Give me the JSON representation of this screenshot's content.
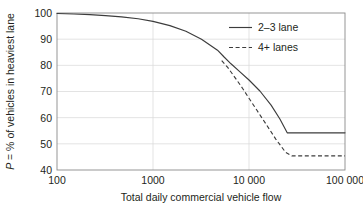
{
  "chart_data": {
    "type": "line",
    "title": "",
    "xlabel": "Total daily commercial vehicle flow",
    "ylabel": "P = % of vehicles in heaviest lane",
    "ylabel_parts": {
      "variable": "P",
      "rest": " = % of vehicles in heaviest lane"
    },
    "xscale": "log",
    "yscale": "linear",
    "xlim": [
      100,
      100000
    ],
    "ylim": [
      40,
      100
    ],
    "grid": true,
    "grid_axes": "both-major",
    "legend_position": "upper-right-inside",
    "xticks": [
      100,
      1000,
      10000,
      100000
    ],
    "xtick_labels": [
      "100",
      "1000",
      "10 000",
      "100 000"
    ],
    "yticks": [
      40,
      50,
      60,
      70,
      80,
      90,
      100
    ],
    "ytick_labels": [
      "40",
      "50",
      "60",
      "70",
      "80",
      "90",
      "100"
    ],
    "series": [
      {
        "name": "2–3 lane",
        "style": "solid",
        "color": "#3c3c3c",
        "points": [
          [
            100,
            99.8
          ],
          [
            150,
            99.6
          ],
          [
            220,
            99.4
          ],
          [
            320,
            99.0
          ],
          [
            470,
            98.5
          ],
          [
            700,
            97.8
          ],
          [
            1000,
            96.8
          ],
          [
            1500,
            95.2
          ],
          [
            2200,
            93.0
          ],
          [
            3200,
            90.0
          ],
          [
            4700,
            85.8
          ],
          [
            5500,
            83.2
          ],
          [
            6500,
            80.6
          ],
          [
            8000,
            77.6
          ],
          [
            10000,
            74.4
          ],
          [
            13000,
            70.2
          ],
          [
            17000,
            64.8
          ],
          [
            21000,
            59.5
          ],
          [
            25000,
            54.2
          ],
          [
            30000,
            54.2
          ],
          [
            50000,
            54.2
          ],
          [
            100000,
            54.2
          ]
        ]
      },
      {
        "name": "4+ lanes",
        "style": "dashed",
        "color": "#3c3c3c",
        "points": [
          [
            5200,
            81.8
          ],
          [
            6000,
            79.2
          ],
          [
            7000,
            75.8
          ],
          [
            8500,
            71.4
          ],
          [
            10000,
            67.4
          ],
          [
            12000,
            63.0
          ],
          [
            15000,
            57.6
          ],
          [
            19000,
            51.8
          ],
          [
            24000,
            46.8
          ],
          [
            28000,
            45.4
          ],
          [
            40000,
            45.4
          ],
          [
            70000,
            45.4
          ],
          [
            100000,
            45.4
          ]
        ]
      }
    ],
    "legend_entries": [
      {
        "label": "2–3 lane",
        "style": "solid"
      },
      {
        "label": "4+ lanes",
        "style": "dashed"
      }
    ],
    "colors": {
      "line": "#3c3c3c",
      "frame": "#7d7d7d",
      "grid": "#d9d9d9",
      "text": "#231f20",
      "background": "#ffffff"
    }
  }
}
